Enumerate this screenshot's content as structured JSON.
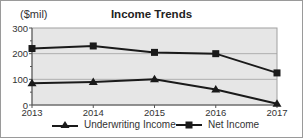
{
  "chart_data": {
    "type": "line",
    "title": "Income Trends",
    "unit_label": "($mil)",
    "xlabel": "",
    "ylabel": "($mil)",
    "categories": [
      "2013",
      "2014",
      "2015",
      "2016",
      "2017"
    ],
    "series": [
      {
        "name": "Underwriting Income",
        "marker": "triangle",
        "values": [
          85,
          90,
          100,
          60,
          5
        ]
      },
      {
        "name": "Net Income",
        "marker": "square",
        "values": [
          220,
          230,
          205,
          200,
          125
        ]
      }
    ],
    "ylim": [
      0,
      300
    ],
    "yticks": [
      "0",
      "100",
      "200",
      "300"
    ],
    "grid": true,
    "legend_position": "bottom",
    "colors": {
      "plot_bg": "#e6e6e6",
      "line": "#1a1a1a",
      "grid": "#a0a0a0"
    }
  }
}
